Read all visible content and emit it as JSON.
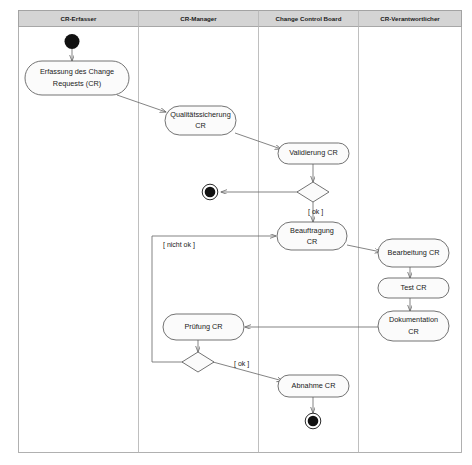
{
  "diagram": {
    "kind": "uml-activity-diagram",
    "colors": {
      "lane_header_fill": "#d4d4d4",
      "node_fill": "#fbfbfb",
      "node_stroke": "#5a5a5a",
      "flow_stroke": "#6e6e6e",
      "lane_divider": "#b8b8b8",
      "text": "#1a1a1a"
    }
  },
  "lanes": [
    {
      "id": "lane-cr-erfasser",
      "label": "CR-Erfasser"
    },
    {
      "id": "lane-cr-manager",
      "label": "CR-Manager"
    },
    {
      "id": "lane-change-control-board",
      "label": "Change Control Board"
    },
    {
      "id": "lane-cr-verantwortlicher",
      "label": "CR-Verantwortlicher"
    }
  ],
  "nodes": {
    "start": {
      "type": "initial-node",
      "lane": "CR-Erfasser"
    },
    "erfassung": {
      "type": "activity",
      "lane": "CR-Erfasser",
      "line1": "Erfassung des Change",
      "line2": "Requests (CR)"
    },
    "qualitaetssicherung": {
      "type": "activity",
      "lane": "CR-Manager",
      "line1": "Qualitätssicherung",
      "line2": "CR"
    },
    "validierung": {
      "type": "activity",
      "lane": "Change Control Board",
      "line1": "Validierung CR",
      "line2": ""
    },
    "decision_validierung": {
      "type": "decision",
      "lane": "Change Control Board"
    },
    "end_abgelehnt": {
      "type": "final-node",
      "lane": "CR-Manager"
    },
    "beauftragung": {
      "type": "activity",
      "lane": "Change Control Board",
      "line1": "Beauftragung",
      "line2": "CR"
    },
    "bearbeitung": {
      "type": "activity",
      "lane": "CR-Verantwortlicher",
      "line1": "Bearbeitung CR",
      "line2": ""
    },
    "test": {
      "type": "activity",
      "lane": "CR-Verantwortlicher",
      "line1": "Test CR",
      "line2": ""
    },
    "dokumentation": {
      "type": "activity",
      "lane": "CR-Verantwortlicher",
      "line1": "Dokumentation",
      "line2": "CR"
    },
    "pruefung": {
      "type": "activity",
      "lane": "CR-Manager",
      "line1": "Prüfung CR",
      "line2": ""
    },
    "decision_pruefung": {
      "type": "decision",
      "lane": "CR-Manager"
    },
    "abnahme": {
      "type": "activity",
      "lane": "Change Control Board",
      "line1": "Abnahme CR",
      "line2": ""
    },
    "end_abgenommen": {
      "type": "final-node",
      "lane": "Change Control Board"
    }
  },
  "guards": {
    "validierung_ok": "[ ok ]",
    "pruefung_nicht_ok": "[ nicht ok ]",
    "pruefung_ok": "[ ok ]"
  }
}
